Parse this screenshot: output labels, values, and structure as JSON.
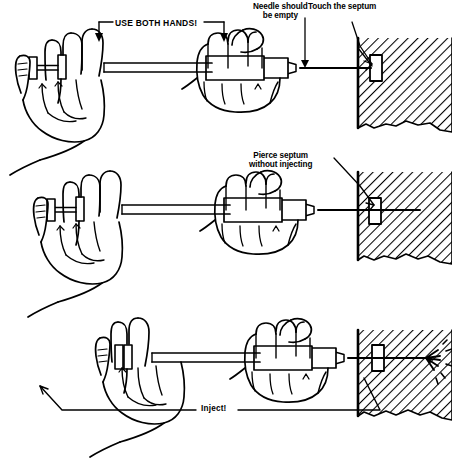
{
  "figure": {
    "ink_color": "#000000",
    "background_color": "#ffffff",
    "panels": [
      {
        "id": "panel-1",
        "step": "1",
        "description": "Both hands hold the syringe; needle empty, tip touches the septum",
        "labels": [
          "use_both_hands",
          "needle_should_be_empty",
          "touch_the_septum"
        ]
      },
      {
        "id": "panel-2",
        "step": "2",
        "description": "Needle pierces the septum without injecting",
        "labels": [
          "pierce_septum_without_injecting"
        ]
      },
      {
        "id": "panel-3",
        "step": "3",
        "description": "Plunger is depressed and contents are injected through the septum",
        "labels": [
          "inject"
        ]
      }
    ]
  },
  "labels": {
    "use_both_hands": "USE BOTH HANDS!",
    "needle_should_be_empty_line1": "Needle should",
    "needle_should_be_empty_line2": "be empty",
    "touch_the_septum": "Touch the septum",
    "pierce_septum_line1": "Pierce septum",
    "pierce_septum_line2": "without injecting",
    "inject": "Inject!"
  }
}
